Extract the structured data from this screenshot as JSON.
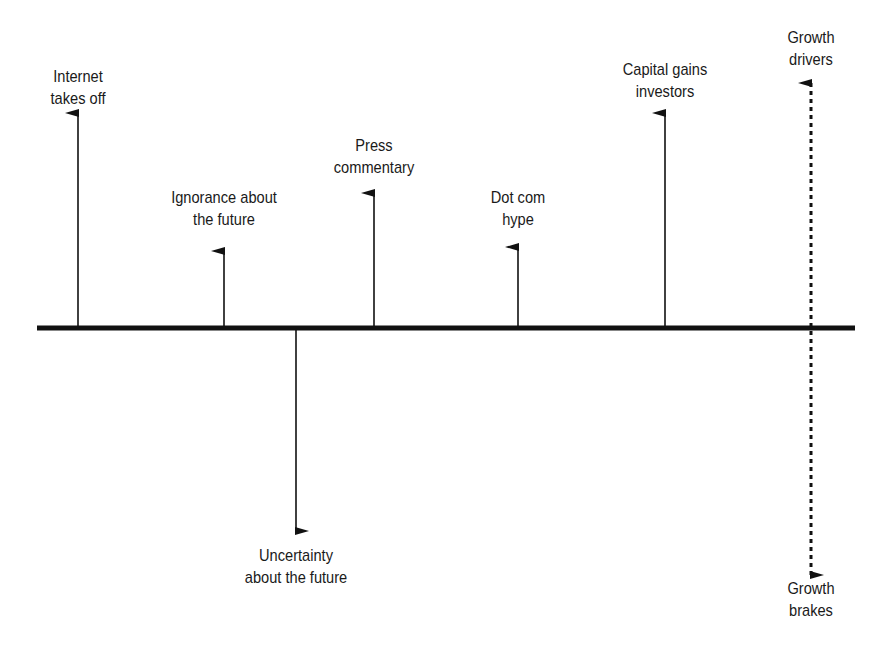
{
  "diagram": {
    "type": "force-field",
    "baseline": {
      "x1": 37,
      "x2": 855,
      "y": 328,
      "thickness": 5,
      "color": "#111111"
    },
    "drivers": [
      {
        "id": "internet",
        "lines": [
          "Internet",
          "takes off"
        ],
        "x": 78,
        "tip_y": 113,
        "label_x": 78,
        "label_y": 66
      },
      {
        "id": "ignorance",
        "lines": [
          "Ignorance about",
          "the future"
        ],
        "x": 224,
        "tip_y": 251,
        "label_x": 224,
        "label_y": 187
      },
      {
        "id": "press",
        "lines": [
          "Press",
          "commentary"
        ],
        "x": 374,
        "tip_y": 193,
        "label_x": 374,
        "label_y": 135
      },
      {
        "id": "dotcom",
        "lines": [
          "Dot com",
          "hype"
        ],
        "x": 518,
        "tip_y": 247,
        "label_x": 518,
        "label_y": 187
      },
      {
        "id": "capital",
        "lines": [
          "Capital gains",
          "investors"
        ],
        "x": 665,
        "tip_y": 113,
        "label_x": 665,
        "label_y": 59
      }
    ],
    "brakes": [
      {
        "id": "uncertainty",
        "lines": [
          "Uncertainty",
          "about the future"
        ],
        "x": 296,
        "tip_y": 531,
        "label_x": 296,
        "label_y": 545
      }
    ],
    "legend": {
      "x": 811,
      "top_tip_y": 83,
      "bottom_tip_y": 575,
      "drivers_label": [
        "Growth",
        "drivers"
      ],
      "brakes_label": [
        "Growth",
        "brakes"
      ],
      "drivers_label_y": 27,
      "brakes_label_y": 578
    }
  }
}
